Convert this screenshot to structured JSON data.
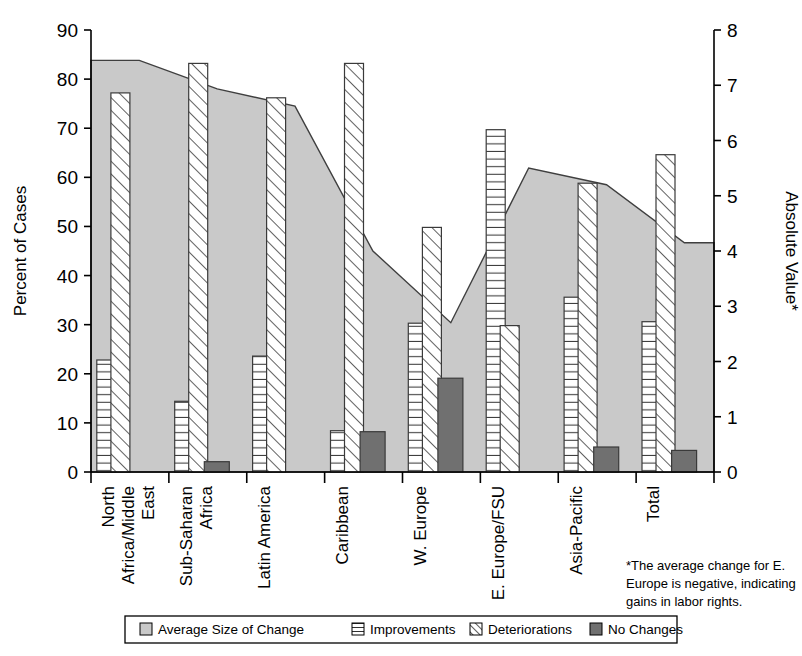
{
  "chart_data": {
    "type": "bar",
    "title": "",
    "subtitle": "",
    "ylabel": "Percent of Cases",
    "y2label": "Absolute Value*",
    "xlabel": "",
    "ylim": [
      0,
      90
    ],
    "y2lim": [
      0,
      8
    ],
    "yticks": [
      "0",
      "10",
      "20",
      "30",
      "40",
      "50",
      "60",
      "70",
      "80",
      "90"
    ],
    "y2ticks": [
      "0",
      "1",
      "2",
      "3",
      "4",
      "5",
      "6",
      "7",
      "8"
    ],
    "grid": false,
    "legend_position": "bottom",
    "categories": [
      "North Africa/Middle East",
      "Sub-Saharan Africa",
      "Latin America",
      "Caribbean",
      "W. Europe",
      "E. Europe/FSU",
      "Asia-Pacific",
      "Total"
    ],
    "category_lines": [
      [
        "North",
        "Africa/Middle",
        "East"
      ],
      [
        "Sub-Saharan",
        "Africa"
      ],
      [
        "Latin America"
      ],
      [
        "Caribbean"
      ],
      [
        "W. Europe"
      ],
      [
        "E. Europe/FSU"
      ],
      [
        "Asia-Pacific"
      ],
      [
        "Total"
      ]
    ],
    "series": [
      {
        "name": "Average Size of Change",
        "type": "area",
        "axis": "right",
        "color": "#c9c9c9",
        "values_right_axis": [
          7.45,
          6.93,
          6.62,
          4.0,
          2.7,
          5.5,
          5.2,
          4.15
        ],
        "values_left_axis_equivalent": [
          83.8,
          78.0,
          74.5,
          45.0,
          30.4,
          61.9,
          58.5,
          46.7
        ]
      },
      {
        "name": "Improvements",
        "type": "bar",
        "axis": "left",
        "color": "#ffffff",
        "pattern": "horizontal-lines",
        "values": [
          22.8,
          14.4,
          23.6,
          8.4,
          30.3,
          69.7,
          35.6,
          30.6
        ]
      },
      {
        "name": "Deteriorations",
        "type": "bar",
        "axis": "left",
        "color": "#ffffff",
        "pattern": "diagonal-lines",
        "values": [
          77.2,
          83.2,
          76.2,
          83.2,
          49.8,
          29.8,
          58.8,
          64.6
        ]
      },
      {
        "name": "No Changes",
        "type": "bar",
        "axis": "left",
        "color": "#707070",
        "pattern": "solid",
        "values": [
          0,
          2.1,
          0,
          8.2,
          19.1,
          0,
          5.1,
          4.4
        ]
      }
    ],
    "annotations": [
      "*The average change for E. Europe is negative, indicating gains in labor rights."
    ]
  },
  "axes": {
    "left_title": "Percent of Cases",
    "right_title": "Absolute Value*"
  },
  "legend": {
    "items": [
      {
        "label": "Average Size of Change",
        "swatch": "gray-solid-swatch"
      },
      {
        "label": "Improvements",
        "swatch": "horizontal-lines-swatch"
      },
      {
        "label": "Deteriorations",
        "swatch": "diagonal-lines-swatch"
      },
      {
        "label": "No Changes",
        "swatch": "dark-gray-swatch"
      }
    ]
  },
  "footnote": {
    "lines": [
      "*The average change for E.",
      "Europe is negative, indicating",
      "gains in labor rights."
    ]
  },
  "colors": {
    "area_fill": "#c9c9c9",
    "no_change_fill": "#707070",
    "bar_outline": "#3a3a3a",
    "axis": "#000000",
    "background": "#ffffff"
  }
}
